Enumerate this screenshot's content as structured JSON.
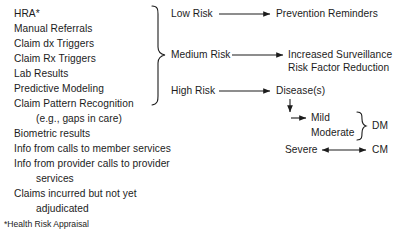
{
  "diagram": {
    "background_color": "#ffffff",
    "line_color": "#1c1c1c",
    "text_color": "#1c1c1c"
  },
  "inputs": {
    "heading": "Data Sources",
    "items": [
      {
        "label": "HRA*",
        "indent": false
      },
      {
        "label": "Manual Referrals",
        "indent": false
      },
      {
        "label": "Claim dx Triggers",
        "indent": false
      },
      {
        "label": "Claim Rx Triggers",
        "indent": false
      },
      {
        "label": "Lab Results",
        "indent": false
      },
      {
        "label": "Predictive Modeling",
        "indent": false
      },
      {
        "label": "Claim Pattern Recognition",
        "indent": false
      },
      {
        "label": "(e.g., gaps in care)",
        "indent": true
      },
      {
        "label": "Biometric results",
        "indent": false
      },
      {
        "label": "Info from calls to member services",
        "indent": false
      },
      {
        "label": "Info from provider calls to provider",
        "indent": false
      },
      {
        "label": "services",
        "indent": true
      },
      {
        "label": "Claims incurred but not yet",
        "indent": false
      },
      {
        "label": "adjudicated",
        "indent": true
      }
    ]
  },
  "footnote": {
    "text": "*Health Risk Appraisal"
  },
  "risk_levels": [
    {
      "label": "Low Risk"
    },
    {
      "label": "Medium Risk"
    },
    {
      "label": "High Risk"
    }
  ],
  "outcomes": {
    "low": [
      "Prevention Reminders"
    ],
    "medium": [
      "Increased Surveillance",
      "Risk Factor Reduction"
    ],
    "high": [
      "Disease(s)"
    ]
  },
  "severity": {
    "items": [
      "Mild",
      "Moderate",
      "Severe"
    ],
    "programs": [
      {
        "label": "DM",
        "applies_to": [
          "Mild",
          "Moderate"
        ]
      },
      {
        "label": "CM",
        "applies_to": [
          "Severe"
        ]
      }
    ]
  }
}
